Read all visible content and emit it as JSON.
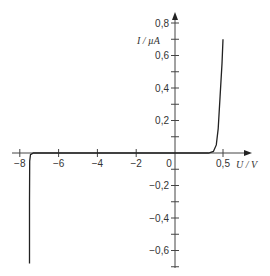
{
  "chart_data": {
    "type": "line",
    "title": "",
    "xlabel": "U / V",
    "ylabel": "I / µA",
    "xlim": [
      -8.1,
      0.6
    ],
    "ylim": [
      -0.7,
      0.85
    ],
    "grid": false,
    "legend": null,
    "x_ticks": [
      {
        "value": -8,
        "label": "−8"
      },
      {
        "value": -6,
        "label": "−6"
      },
      {
        "value": -4,
        "label": "−4"
      },
      {
        "value": -2,
        "label": "−2"
      },
      {
        "value": 0,
        "label": "0"
      },
      {
        "value": 0.5,
        "label": "0,5"
      }
    ],
    "y_ticks": [
      {
        "value": 0.8,
        "label": "0,8"
      },
      {
        "value": 0.6,
        "label": "0,6"
      },
      {
        "value": 0.4,
        "label": "0,4"
      },
      {
        "value": 0.2,
        "label": "0,2"
      },
      {
        "value": -0.2,
        "label": "−0,2"
      },
      {
        "value": -0.4,
        "label": "−0,4"
      },
      {
        "value": -0.6,
        "label": "−0,6"
      }
    ],
    "series": [
      {
        "name": "diode I-U characteristic",
        "color": "#222222",
        "points": [
          [
            -7.5,
            -0.68
          ],
          [
            -7.5,
            -0.3
          ],
          [
            -7.49,
            -0.05
          ],
          [
            -7.45,
            -0.01
          ],
          [
            -7.3,
            0.0
          ],
          [
            -6,
            0.0
          ],
          [
            -4,
            0.0
          ],
          [
            -2,
            0.0
          ],
          [
            0,
            0.0
          ],
          [
            0.35,
            0.0
          ],
          [
            0.4,
            0.01
          ],
          [
            0.43,
            0.05
          ],
          [
            0.45,
            0.15
          ],
          [
            0.47,
            0.35
          ],
          [
            0.49,
            0.55
          ],
          [
            0.5,
            0.7
          ]
        ]
      }
    ]
  }
}
